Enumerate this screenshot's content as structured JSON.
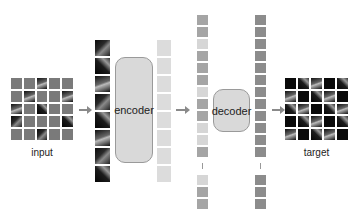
{
  "labels": {
    "input": "input",
    "encoder": "encoder",
    "decoder": "decoder",
    "target": "target"
  },
  "input_grid": {
    "rows": 5,
    "cols": 5,
    "visible_patches": [
      [
        0,
        2
      ],
      [
        1,
        1
      ],
      [
        1,
        4
      ],
      [
        2,
        0
      ],
      [
        2,
        2
      ],
      [
        3,
        0
      ],
      [
        3,
        4
      ],
      [
        4,
        2
      ]
    ]
  },
  "visible_patch_count": 8,
  "encoded_token_count": 8,
  "decoder_input_tokens": {
    "shown_before_ellipsis": 12,
    "shown_after_ellipsis": 3,
    "shades": [
      "#a5a5a5",
      "#a5a5a5",
      "#d6d6d6",
      "#a5a5a5",
      "#a5a5a5",
      "#a5a5a5",
      "#d6d6d6",
      "#a5a5a5",
      "#a5a5a5",
      "#d6d6d6",
      "#d6d6d6",
      "#a5a5a5",
      "#d6d6d6",
      "#a5a5a5",
      "#a5a5a5"
    ]
  },
  "decoder_output_tokens": {
    "shown_before_ellipsis": 12,
    "shown_after_ellipsis": 3,
    "color": "#8c8c8c"
  },
  "colors": {
    "masked_patch": "#7a7a7a",
    "encoded_token": "#dcdcdc",
    "mask_token": "#d6d6d6",
    "block_fill": "#d9d9d9",
    "arrow": "#8a8a8a"
  }
}
